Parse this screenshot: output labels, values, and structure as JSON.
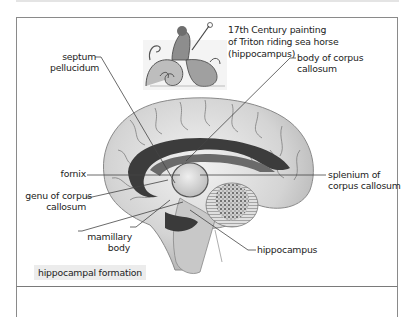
{
  "figure": {
    "painting_caption": [
      "17th Century painting",
      "of Triton riding sea horse",
      "(hippocampus)"
    ],
    "caption_box": "hippocampal formation",
    "labels": {
      "septum_pellucidum": [
        "septum",
        "pellucidum"
      ],
      "body_of_corpus_callosum": [
        "body of corpus",
        "callosum"
      ],
      "fornix": [
        "fornix"
      ],
      "genu_of_corpus_callosum": [
        "genu of corpus",
        "callosum"
      ],
      "mamillary_body": [
        "mamillary",
        "body"
      ],
      "splenium_of_corpus_callosum": [
        "splenium of",
        "corpus callosum"
      ],
      "hippocampus": [
        "hippocampus"
      ]
    },
    "colors": {
      "border": "#8a8a8a",
      "leader_line": "#444444",
      "caption_bg": "#ececec",
      "corpus_callosum": "#3c3c3c",
      "brain_light": "#d8d8d8"
    }
  }
}
